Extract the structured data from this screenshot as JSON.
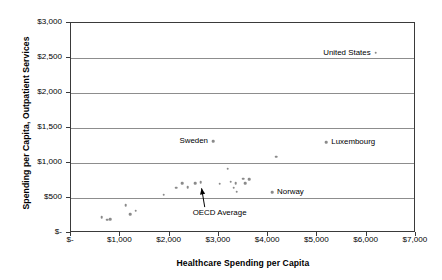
{
  "chart_data": {
    "type": "scatter",
    "title": "",
    "xlabel": "Healthcare Spending per Capita",
    "ylabel": "Spending per Capita, Outpatient Services",
    "xlim": [
      0,
      7000
    ],
    "ylim": [
      0,
      3000
    ],
    "xticks": [
      0,
      1000,
      2000,
      3000,
      4000,
      5000,
      6000,
      7000
    ],
    "xtick_labels": [
      "$-",
      "$1,000",
      "$2,000",
      "$3,000",
      "$4,000",
      "$5,000",
      "$6,000",
      "$7,000"
    ],
    "yticks": [
      0,
      500,
      1000,
      1500,
      2000,
      2500,
      3000
    ],
    "ytick_labels": [
      "$-",
      "$500",
      "$1,000",
      "$1,500",
      "$2,000",
      "$2,500",
      "$3,000"
    ],
    "grid": "horizontal",
    "legend": "none",
    "marker_color": "#8a8a8a",
    "points": [
      {
        "x": 640,
        "y": 215
      },
      {
        "x": 760,
        "y": 175
      },
      {
        "x": 820,
        "y": 180
      },
      {
        "x": 1130,
        "y": 385
      },
      {
        "x": 1220,
        "y": 255
      },
      {
        "x": 1330,
        "y": 305
      },
      {
        "x": 1900,
        "y": 535
      },
      {
        "x": 2150,
        "y": 635
      },
      {
        "x": 2280,
        "y": 700
      },
      {
        "x": 2390,
        "y": 640
      },
      {
        "x": 2540,
        "y": 700
      },
      {
        "x": 2650,
        "y": 710
      },
      {
        "x": 2900,
        "y": 1300
      },
      {
        "x": 3040,
        "y": 690
      },
      {
        "x": 3200,
        "y": 905
      },
      {
        "x": 3260,
        "y": 720
      },
      {
        "x": 3320,
        "y": 630
      },
      {
        "x": 3360,
        "y": 700
      },
      {
        "x": 3380,
        "y": 575
      },
      {
        "x": 3520,
        "y": 760
      },
      {
        "x": 3560,
        "y": 700
      },
      {
        "x": 3640,
        "y": 755
      },
      {
        "x": 4100,
        "y": 570
      },
      {
        "x": 4180,
        "y": 1075
      },
      {
        "x": 5200,
        "y": 1280
      },
      {
        "x": 6200,
        "y": 2560
      }
    ],
    "point_labels": [
      {
        "label": "United States",
        "x": 6200,
        "y": 2560,
        "side": "left"
      },
      {
        "label": "Luxembourg",
        "x": 5200,
        "y": 1280,
        "side": "right"
      },
      {
        "label": "Sweden",
        "x": 2900,
        "y": 1300,
        "side": "left"
      },
      {
        "label": "Norway",
        "x": 4100,
        "y": 570,
        "side": "right"
      }
    ],
    "annotations": [
      {
        "label": "OECD Average",
        "point_x": 2650,
        "point_y": 710,
        "text_x": 2490,
        "text_y": 270
      }
    ]
  }
}
